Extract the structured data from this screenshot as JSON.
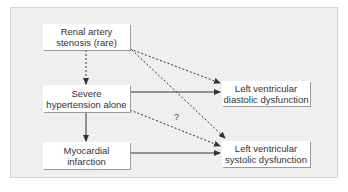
{
  "diagram": {
    "nodes": [
      {
        "id": "renal",
        "label": "Renal artery\nstenosis (rare)"
      },
      {
        "id": "severe",
        "label": "Severe\nhypertension alone"
      },
      {
        "id": "mi",
        "label": "Myocardial\ninfarction"
      },
      {
        "id": "diastolic",
        "label": "Left ventricular\ndiastolic dysfunction"
      },
      {
        "id": "systolic",
        "label": "Left ventricular\nsystolic dysfunction"
      }
    ],
    "edges": [
      {
        "from": "renal",
        "to": "severe",
        "style": "dashed"
      },
      {
        "from": "renal",
        "to": "diastolic",
        "style": "dashed"
      },
      {
        "from": "renal",
        "to": "systolic",
        "style": "dashed"
      },
      {
        "from": "severe",
        "to": "diastolic",
        "style": "solid"
      },
      {
        "from": "severe",
        "to": "systolic",
        "style": "dashed",
        "label": "?"
      },
      {
        "from": "severe",
        "to": "mi",
        "style": "solid"
      },
      {
        "from": "mi",
        "to": "systolic",
        "style": "solid"
      }
    ],
    "question_mark": "?"
  }
}
